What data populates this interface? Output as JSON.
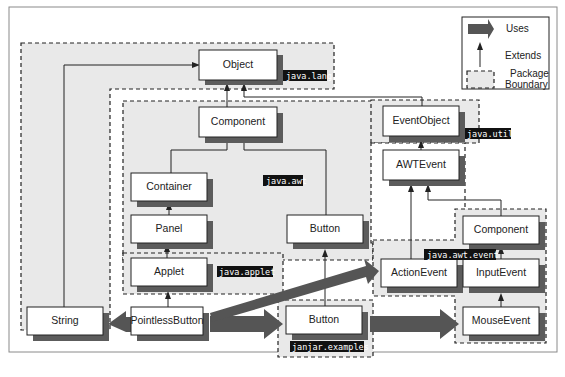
{
  "legend": {
    "uses_label": "Uses",
    "extends_label": "Extends",
    "package_label_line1": "Package",
    "package_label_line2": "Boundary"
  },
  "packages": {
    "java_lang": "java.lang",
    "java_awt": "java.awt",
    "java_util": "java.util",
    "java_applet": "java.applet",
    "java_awt_event": "java.awt.event",
    "janjar_examples": "janjar.examples"
  },
  "classes": {
    "object": "Object",
    "component": "Component",
    "event_object": "EventObject",
    "awt_event": "AWTEvent",
    "container": "Container",
    "panel": "Panel",
    "awt_button": "Button",
    "applet": "Applet",
    "string": "String",
    "pointless_button": "PointlessButton",
    "examples_button": "Button",
    "action_event": "ActionEvent",
    "component_event": "Component",
    "input_event": "InputEvent",
    "mouse_event": "MouseEvent"
  },
  "relations": {
    "extends": [
      [
        "String",
        "Object"
      ],
      [
        "Component",
        "Object"
      ],
      [
        "EventObject",
        "Object"
      ],
      [
        "Container",
        "Component"
      ],
      [
        "Button (java.awt)",
        "Component"
      ],
      [
        "Panel",
        "Container"
      ],
      [
        "Applet",
        "Panel"
      ],
      [
        "PointlessButton",
        "Applet"
      ],
      [
        "Button (janjar.examples)",
        "Button (java.awt)"
      ],
      [
        "AWTEvent",
        "EventObject"
      ],
      [
        "ActionEvent",
        "AWTEvent"
      ],
      [
        "ComponentEvent",
        "AWTEvent"
      ],
      [
        "InputEvent",
        "ComponentEvent"
      ],
      [
        "MouseEvent",
        "InputEvent"
      ]
    ],
    "uses": [
      [
        "PointlessButton",
        "String"
      ],
      [
        "PointlessButton",
        "ActionEvent"
      ],
      [
        "PointlessButton",
        "Button (janjar.examples)"
      ],
      [
        "Button (janjar.examples)",
        "MouseEvent"
      ]
    ]
  }
}
